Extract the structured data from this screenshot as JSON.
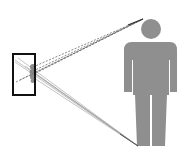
{
  "diagram": {
    "colors": {
      "background": "#ffffff",
      "frame_border": "#111111",
      "figure_fill": "#8f8f8f",
      "dashed_lines": "#6a6a6a",
      "solid_lines": "#9a9a9a",
      "lens_cluster": "#7a7a7a"
    },
    "frame": {
      "x": 13,
      "y": 54,
      "width": 22,
      "height": 41
    },
    "head_target": {
      "x": 143,
      "y": 19
    },
    "feet_target": {
      "x": 138,
      "y": 146
    },
    "figure": {
      "head": {
        "cx": 151,
        "cy": 29,
        "r": 10
      }
    }
  }
}
